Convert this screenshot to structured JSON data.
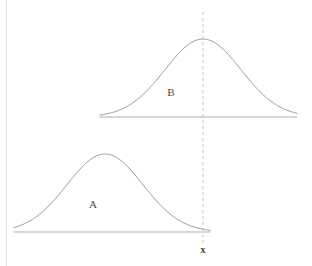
{
  "figure": {
    "title": "",
    "background_color": "#ffffff",
    "frame": {
      "name": "left-border",
      "x": 6.5,
      "y_top": 0,
      "y_bottom": 266,
      "color": "#e2e2e2"
    },
    "curve_color": "#8a8a8a",
    "axis_color": "#9a9a9a",
    "marker_color": "#b4b4b4",
    "label_color": "#4a4a4a"
  },
  "marker": {
    "name": "x-reference-line",
    "label": "x",
    "x": 203,
    "y_top": 12,
    "y_bottom": 243,
    "label_x": 203,
    "label_y": 251,
    "style": "dashed"
  },
  "distributions": [
    {
      "id": "B",
      "label": "B",
      "label_x": 171,
      "label_y": 93,
      "baseline_y": 117,
      "baseline_x_start": 100,
      "baseline_x_end": 297,
      "peak_x": 203,
      "peak_y": 39,
      "peak_height": 78,
      "sigma": 38,
      "position": "upper",
      "mean_relative_to_x": "equal"
    },
    {
      "id": "A",
      "label": "A",
      "label_x": 93,
      "label_y": 205,
      "baseline_y": 232,
      "baseline_x_start": 14,
      "baseline_x_end": 210,
      "peak_x": 105,
      "peak_y": 154,
      "peak_height": 78,
      "sigma": 38,
      "position": "lower",
      "mean_relative_to_x": "less"
    }
  ],
  "chart_data": {
    "type": "line",
    "title": "",
    "xlabel": "x",
    "ylabel": "",
    "grid": false,
    "legend": "inline-annotations",
    "annotations": [
      {
        "text": "A",
        "x": 93,
        "y": 205
      },
      {
        "text": "B",
        "x": 171,
        "y": 93
      },
      {
        "text": "x",
        "x": 203,
        "y": 251
      }
    ],
    "series": [
      {
        "name": "B",
        "kind": "normal-density",
        "mean": 203,
        "sigma": 38,
        "amplitude": 78,
        "baseline": 117,
        "x_range": [
          100,
          297
        ]
      },
      {
        "name": "A",
        "kind": "normal-density",
        "mean": 105,
        "sigma": 38,
        "amplitude": 78,
        "baseline": 232,
        "x_range": [
          14,
          210
        ]
      }
    ],
    "reference_lines": [
      {
        "name": "x",
        "orientation": "vertical",
        "value": 203,
        "style": "dashed"
      }
    ]
  }
}
